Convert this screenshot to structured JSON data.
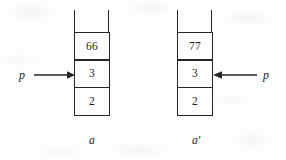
{
  "figure": {
    "background_color": "#fdfdfd",
    "stroke_color": "#252525",
    "text_color": "#1c1c1c"
  },
  "stacks": [
    {
      "id": "left",
      "caption": "a",
      "cells": [
        {
          "value": "66",
          "name": "cell-top"
        },
        {
          "value": "3",
          "name": "cell-middle"
        },
        {
          "value": "2",
          "name": "cell-bottom"
        }
      ],
      "pointer": {
        "label": "p",
        "direction": "right",
        "targets": "cell-middle"
      }
    },
    {
      "id": "right",
      "caption": "a′",
      "cells": [
        {
          "value": "77",
          "name": "cell-top"
        },
        {
          "value": "3",
          "name": "cell-middle"
        },
        {
          "value": "2",
          "name": "cell-bottom"
        }
      ],
      "pointer": {
        "label": "p",
        "direction": "left",
        "targets": "cell-middle"
      }
    }
  ]
}
